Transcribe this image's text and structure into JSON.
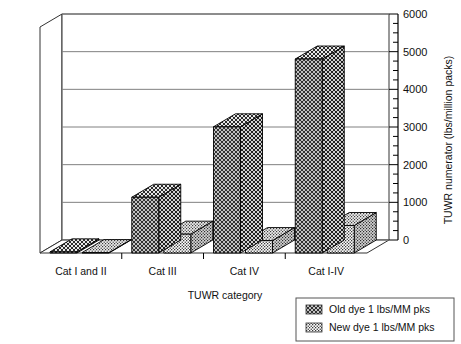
{
  "chart_data": {
    "type": "bar",
    "title": "",
    "subtitle": "",
    "xlabel": "TUWR category",
    "ylabel": "TUWR numerator (lbs/million packs)",
    "categories": [
      "Cat I and II",
      "Cat III",
      "Cat IV",
      "Cat I-IV"
    ],
    "series": [
      {
        "name": "Old dye 1 lbs/MM pks",
        "pattern": "diagonal-crosshatch",
        "values": [
          30,
          1480,
          3350,
          5150
        ]
      },
      {
        "name": "New dye 1 lbs/MM pks",
        "pattern": "dotted-stipple",
        "values": [
          10,
          500,
          330,
          730
        ]
      }
    ],
    "ylim": [
      0,
      6000
    ],
    "ytick_labels": [
      "0",
      "1000",
      "2000",
      "3000",
      "4000",
      "5000",
      "6000"
    ],
    "ytick_values": [
      0,
      1000,
      2000,
      3000,
      4000,
      5000,
      6000
    ],
    "minor_tick_interval": 250,
    "grid": "horizontal-major",
    "legend_position": "bottom-right",
    "style": "3d-bar",
    "axis_color": "#000000",
    "grid_color": "#808080",
    "bar_outline_color": "#000000",
    "background_color": "#ffffff"
  },
  "legend": {
    "items": [
      {
        "label": "Old dye 1 lbs/MM pks",
        "swatch": "diagonal-crosshatch-swatch"
      },
      {
        "label": "New dye 1 lbs/MM pks",
        "swatch": "dotted-stipple-swatch"
      }
    ]
  }
}
